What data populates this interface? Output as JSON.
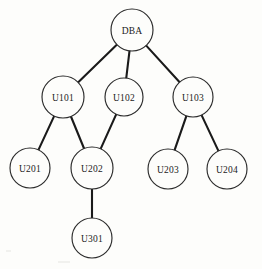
{
  "figure": {
    "background_color": "#fdfdfb",
    "node_fill": "#fdfdfb",
    "node_stroke": "#2b2b2b",
    "edge_color": "#1a1a1a"
  },
  "chart_data": {
    "type": "diagram",
    "diagram_kind": "tree",
    "orientation": "top-down",
    "nodes": [
      {
        "id": "DBA",
        "label": "DBA",
        "cx": 132,
        "cy": 30,
        "r": 21,
        "level": 0
      },
      {
        "id": "U101",
        "label": "U101",
        "cx": 63,
        "cy": 97,
        "r": 21,
        "level": 1
      },
      {
        "id": "U102",
        "label": "U102",
        "cx": 124,
        "cy": 97,
        "r": 19,
        "level": 1
      },
      {
        "id": "U103",
        "label": "U103",
        "cx": 193,
        "cy": 97,
        "r": 20,
        "level": 1
      },
      {
        "id": "U201",
        "label": "U201",
        "cx": 30,
        "cy": 168,
        "r": 20,
        "level": 2
      },
      {
        "id": "U202",
        "label": "U202",
        "cx": 92,
        "cy": 168,
        "r": 21,
        "level": 2
      },
      {
        "id": "U203",
        "label": "U203",
        "cx": 168,
        "cy": 169,
        "r": 20,
        "level": 2
      },
      {
        "id": "U204",
        "label": "U204",
        "cx": 227,
        "cy": 169,
        "r": 20,
        "level": 2
      },
      {
        "id": "U301",
        "label": "U301",
        "cx": 92,
        "cy": 238,
        "r": 20,
        "level": 3
      }
    ],
    "edges": [
      {
        "from": "DBA",
        "to": "U101"
      },
      {
        "from": "DBA",
        "to": "U102"
      },
      {
        "from": "DBA",
        "to": "U103"
      },
      {
        "from": "U101",
        "to": "U201"
      },
      {
        "from": "U101",
        "to": "U202"
      },
      {
        "from": "U102",
        "to": "U202"
      },
      {
        "from": "U103",
        "to": "U203"
      },
      {
        "from": "U103",
        "to": "U204"
      },
      {
        "from": "U202",
        "to": "U301"
      }
    ]
  }
}
